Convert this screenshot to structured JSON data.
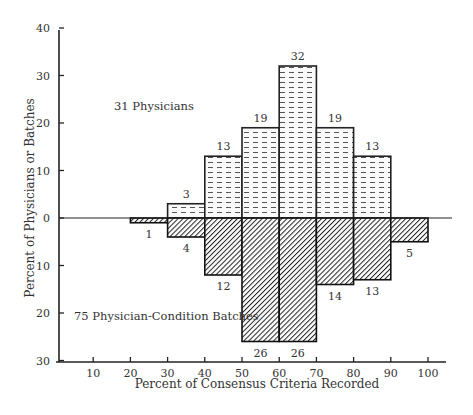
{
  "chart_data": {
    "type": "bar",
    "title": "",
    "xlabel": "Percent of Consensus Criteria Recorded",
    "ylabel": "Percent of Physicians or Batches",
    "x_ticks": [
      10,
      20,
      30,
      40,
      50,
      60,
      70,
      80,
      90,
      100
    ],
    "y_ticks_up": [
      0,
      10,
      20,
      30,
      40
    ],
    "y_ticks_down": [
      10,
      20,
      30
    ],
    "xlim": [
      0,
      105
    ],
    "ylim": [
      -30,
      40
    ],
    "grid": false,
    "legend": "none (text annotations)",
    "categories": [
      "20-30",
      "30-40",
      "40-50",
      "50-60",
      "60-70",
      "70-80",
      "80-90",
      "90-100"
    ],
    "bins": [
      [
        20,
        30
      ],
      [
        30,
        40
      ],
      [
        40,
        50
      ],
      [
        50,
        60
      ],
      [
        60,
        70
      ],
      [
        70,
        80
      ],
      [
        80,
        90
      ],
      [
        90,
        100
      ]
    ],
    "series": [
      {
        "name": "31 Physicians",
        "direction": "up",
        "pattern": "dashed-horizontal",
        "values": [
          0,
          3,
          13,
          19,
          32,
          19,
          13,
          0
        ],
        "labels": [
          "",
          "3",
          "13",
          "19",
          "32",
          "19",
          "13",
          ""
        ]
      },
      {
        "name": "75 Physician-Condition Batches",
        "direction": "down",
        "pattern": "diagonal-hatch",
        "values": [
          1,
          4,
          12,
          26,
          26,
          14,
          13,
          5
        ],
        "labels": [
          "1",
          "4",
          "12",
          "26",
          "26",
          "14",
          "13",
          "5"
        ]
      }
    ],
    "annotations": [
      "31 Physicians",
      "75 Physician-Condition Batches"
    ]
  },
  "labels": {
    "xlabel": "Percent of Consensus Criteria Recorded",
    "ylabel": "Percent of Physicians or Batches",
    "annot_top": "31 Physicians",
    "annot_bottom": "75 Physician-Condition Batches"
  }
}
